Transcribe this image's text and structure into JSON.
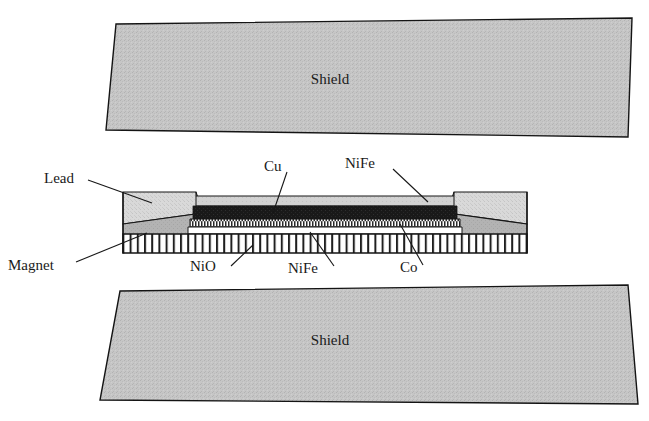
{
  "figure": {
    "type": "cross-section-schematic",
    "background_color": "#ffffff",
    "line_color": "#141414"
  },
  "shields": [
    {
      "id": "top-shield",
      "label": "Shield",
      "fill": "#c4c4c4",
      "texture": "stipple",
      "label_x": 330,
      "label_y": 84
    },
    {
      "id": "bottom-shield",
      "label": "Shield",
      "fill": "#c4c4c4",
      "texture": "stipple",
      "label_x": 330,
      "label_y": 345
    }
  ],
  "leads": [
    {
      "id": "left-lead",
      "label": "Lead",
      "fill": "#d6d6d6",
      "texture": "stipple"
    },
    {
      "id": "right-lead",
      "label": "Lead",
      "fill": "#d6d6d6",
      "texture": "stipple"
    }
  ],
  "magnets": [
    {
      "id": "left-magnet",
      "label": "Magnet",
      "fill": "#b0b0b0",
      "texture": "solid-gray"
    },
    {
      "id": "right-magnet",
      "label": "Magnet",
      "fill": "#b0b0b0",
      "texture": "solid-gray"
    }
  ],
  "stack_layers": [
    {
      "id": "layer-nife-top",
      "material": "NiFe",
      "fill": "#d0d0d0",
      "texture": "light-gray",
      "top": 196,
      "bottom": 206,
      "order": 1
    },
    {
      "id": "layer-cu",
      "material": "Cu",
      "fill": "#1b1b1b",
      "texture": "solid-black",
      "top": 206,
      "bottom": 219,
      "order": 2
    },
    {
      "id": "layer-co",
      "material": "Co",
      "fill": "#ffffff",
      "texture": "fine-checker",
      "top": 219,
      "bottom": 227,
      "order": 3
    },
    {
      "id": "layer-nife-bottom",
      "material": "NiFe",
      "fill": "#ffffff",
      "texture": "white",
      "top": 227,
      "bottom": 234,
      "order": 4
    },
    {
      "id": "layer-nio",
      "material": "NiO",
      "fill": "#ffffff",
      "texture": "vertical-bars",
      "top": 234,
      "bottom": 253,
      "order": 5
    }
  ],
  "labels": [
    {
      "id": "label-lead",
      "text": "Lead",
      "x": 44,
      "y": 183,
      "anchor": "start"
    },
    {
      "id": "label-magnet",
      "text": "Magnet",
      "x": 8,
      "y": 270,
      "anchor": "start"
    },
    {
      "id": "label-cu",
      "text": "Cu",
      "x": 264,
      "y": 171,
      "anchor": "start"
    },
    {
      "id": "label-nife-top",
      "text": "NiFe",
      "x": 345,
      "y": 168,
      "anchor": "start"
    },
    {
      "id": "label-nio",
      "text": "NiO",
      "x": 190,
      "y": 271,
      "anchor": "start"
    },
    {
      "id": "label-nife-bottom",
      "text": "NiFe",
      "x": 288,
      "y": 273,
      "anchor": "start"
    },
    {
      "id": "label-co",
      "text": "Co",
      "x": 400,
      "y": 272,
      "anchor": "start"
    },
    {
      "id": "label-shield-top",
      "text": "Shield",
      "x": 330,
      "y": 84,
      "anchor": "middle"
    },
    {
      "id": "label-shield-bot",
      "text": "Shield",
      "x": 330,
      "y": 345,
      "anchor": "middle"
    }
  ]
}
